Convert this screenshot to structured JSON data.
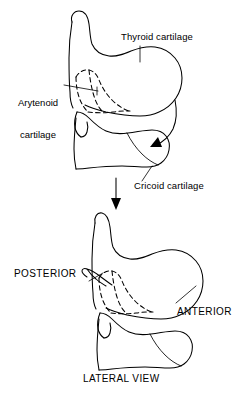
{
  "figure": {
    "title_caption": "LATERAL VIEW",
    "background_color": "#ffffff",
    "line_color": "#000000",
    "panels": [
      {
        "name": "upper-panel",
        "description": "Separated larynx cartilages, lateral view",
        "labels": [
          {
            "id": "thyroid",
            "text": "Thyroid cartilage"
          },
          {
            "id": "arytenoid_line1",
            "text": "Arytenoid"
          },
          {
            "id": "arytenoid_line2",
            "text": "cartilage"
          },
          {
            "id": "cricoid",
            "text": "Cricoid cartilage"
          }
        ]
      },
      {
        "name": "lower-panel",
        "description": "Assembled larynx cartilages, lateral view",
        "labels": [
          {
            "id": "posterior",
            "text": "POSTERIOR"
          },
          {
            "id": "anterior",
            "text": "ANTERIOR"
          },
          {
            "id": "lateral_view",
            "text": "LATERAL VIEW"
          }
        ]
      }
    ]
  },
  "labels": {
    "thyroid_cartilage": "Thyroid cartilage",
    "arytenoid_cartilage_line1": "Arytenoid",
    "arytenoid_cartilage_line2": "cartilage",
    "cricoid_cartilage": "Cricoid cartilage",
    "posterior": "POSTERIOR",
    "anterior": "ANTERIOR",
    "lateral_view": "LATERAL VIEW"
  },
  "icons": {
    "assembly_arrow": "down-arrow-icon",
    "cricoid_pointer_arrow": "curved-arrow-icon"
  }
}
